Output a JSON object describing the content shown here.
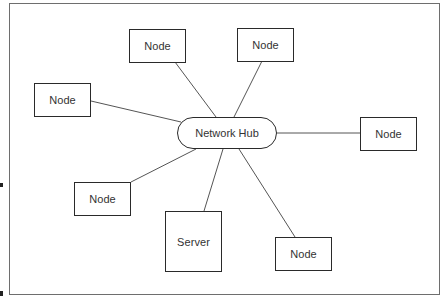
{
  "diagram": {
    "type": "star-network-topology",
    "hub": {
      "label": "Network Hub",
      "x": 177,
      "y": 117,
      "w": 100,
      "h": 32
    },
    "nodes": [
      {
        "id": "node-left",
        "label": "Node",
        "x": 34,
        "y": 83,
        "w": 57,
        "h": 34,
        "link": [
          91,
          101,
          181,
          122
        ]
      },
      {
        "id": "node-top-left",
        "label": "Node",
        "x": 129,
        "y": 29,
        "w": 57,
        "h": 34,
        "link": [
          175,
          62,
          216,
          117
        ]
      },
      {
        "id": "node-top-right",
        "label": "Node",
        "x": 237,
        "y": 28,
        "w": 57,
        "h": 34,
        "link": [
          262,
          61,
          234,
          117
        ]
      },
      {
        "id": "node-right",
        "label": "Node",
        "x": 360,
        "y": 117,
        "w": 57,
        "h": 34,
        "link": [
          277,
          133,
          360,
          133
        ]
      },
      {
        "id": "node-bottom-left",
        "label": "Node",
        "x": 74,
        "y": 182,
        "w": 57,
        "h": 34,
        "link": [
          196,
          149,
          131,
          182
        ]
      },
      {
        "id": "server",
        "label": "Server",
        "x": 165,
        "y": 211,
        "w": 57,
        "h": 61,
        "link": [
          223,
          149,
          204,
          211
        ]
      },
      {
        "id": "node-bottom-right",
        "label": "Node",
        "x": 275,
        "y": 237,
        "w": 57,
        "h": 34,
        "link": [
          239,
          149,
          295,
          237
        ]
      }
    ],
    "colors": {
      "line": "#555555",
      "border": "#2a2a2a",
      "text": "#333333",
      "background": "#ffffff"
    }
  }
}
